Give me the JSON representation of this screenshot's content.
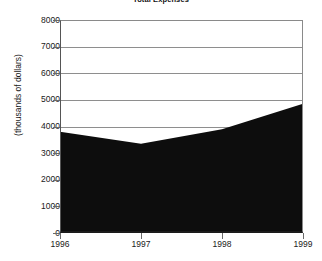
{
  "chart_data": {
    "type": "area",
    "title": "Total Expenses",
    "xlabel": "",
    "ylabel": "(thousands of dollars)",
    "categories": [
      "1996",
      "1997",
      "1998",
      "1999"
    ],
    "values": [
      3800,
      3350,
      3900,
      4850
    ],
    "series": [
      {
        "name": "Total Expenses",
        "values": [
          3800,
          3350,
          3900,
          4850
        ]
      }
    ],
    "ylim": [
      0,
      8000
    ],
    "ytick_labels": [
      "8000",
      "7000",
      "6000",
      "5000",
      "4000",
      "3000",
      "2000",
      "1000",
      "0"
    ],
    "ytick_values": [
      8000,
      7000,
      6000,
      5000,
      4000,
      3000,
      2000,
      1000,
      0
    ],
    "grid": true,
    "legend": false,
    "legend_position": "none",
    "colors": {
      "area_fill": "#0d0d0d",
      "gridline": "#8e8e8e",
      "axis": "#1b1b1b",
      "text": "#1a1a1a",
      "background": "#ffffff"
    }
  }
}
